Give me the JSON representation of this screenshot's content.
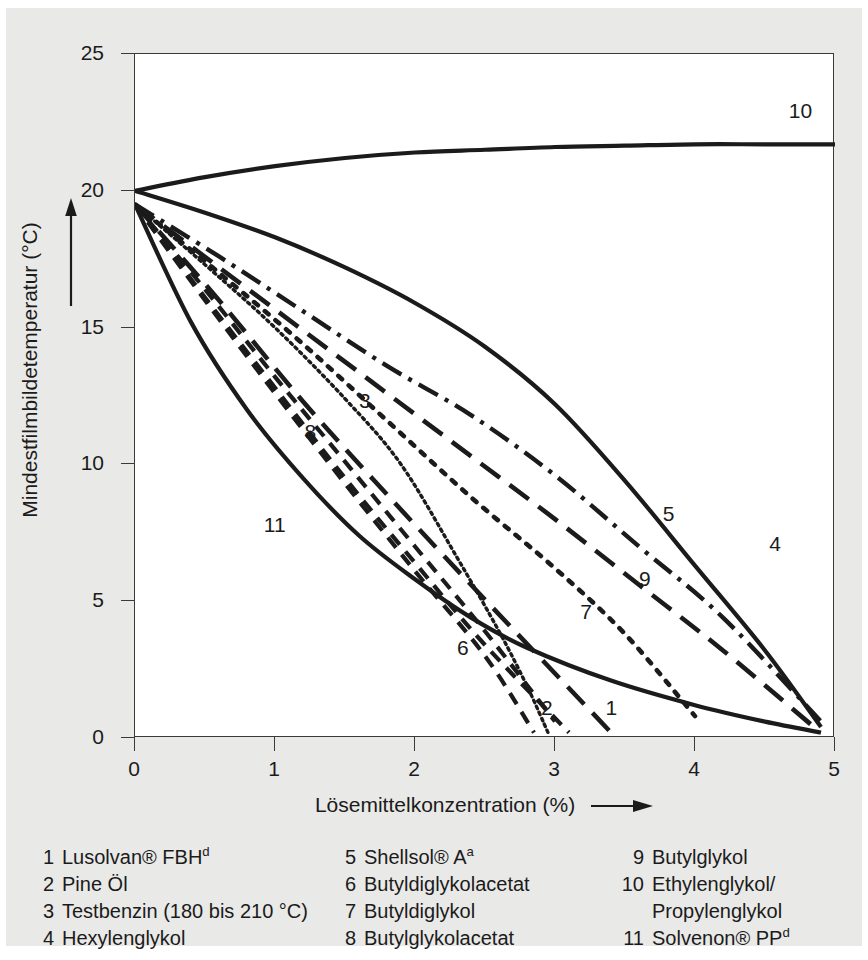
{
  "chart_data": {
    "type": "line",
    "title": "",
    "xlabel": "Lösemittelkonzentration (%)",
    "ylabel": "Mindestfilmbildetemperatur (°C)",
    "xlim": [
      0,
      5
    ],
    "ylim": [
      0,
      25
    ],
    "xticks": [
      0,
      1,
      2,
      3,
      4,
      5
    ],
    "yticks": [
      0,
      5,
      10,
      15,
      20,
      25
    ],
    "xtick_labels": [
      "0",
      "1",
      "2",
      "3",
      "4",
      "5"
    ],
    "ytick_labels": [
      "0",
      "5",
      "10",
      "15",
      "20",
      "25"
    ],
    "grid": false,
    "legend_position": "below-plot",
    "x_axis_arrow": true,
    "y_axis_arrow": true,
    "series": [
      {
        "name": "1",
        "label": "Lusolvan® FBH",
        "style": "long-dash",
        "points": [
          [
            0,
            19.5
          ],
          [
            0.6,
            16.0
          ],
          [
            1.2,
            12.3
          ],
          [
            1.8,
            8.9
          ],
          [
            2.4,
            5.6
          ],
          [
            2.9,
            2.9
          ],
          [
            3.4,
            0.2
          ]
        ]
      },
      {
        "name": "2",
        "label": "Pine Öl",
        "style": "dashed",
        "points": [
          [
            0,
            19.5
          ],
          [
            0.5,
            16.1
          ],
          [
            1.0,
            12.8
          ],
          [
            1.5,
            9.5
          ],
          [
            2.0,
            6.4
          ],
          [
            2.5,
            3.4
          ],
          [
            3.1,
            0.2
          ]
        ]
      },
      {
        "name": "3",
        "label": "Testbenzin (180 bis 210 °C)",
        "style": "fine-dot",
        "points": [
          [
            0,
            19.5
          ],
          [
            0.5,
            17.3
          ],
          [
            1.0,
            15.0
          ],
          [
            1.5,
            12.4
          ],
          [
            1.9,
            10.0
          ],
          [
            2.3,
            6.6
          ],
          [
            2.6,
            3.9
          ],
          [
            2.8,
            1.9
          ],
          [
            2.95,
            0.2
          ]
        ]
      },
      {
        "name": "4",
        "label": "Hexylenglykol",
        "style": "solid",
        "points": [
          [
            0,
            20.0
          ],
          [
            0.5,
            19.2
          ],
          [
            1.0,
            18.3
          ],
          [
            1.5,
            17.2
          ],
          [
            2.0,
            15.9
          ],
          [
            2.5,
            14.3
          ],
          [
            3.0,
            12.2
          ],
          [
            3.5,
            9.4
          ],
          [
            4.0,
            6.3
          ],
          [
            4.5,
            3.2
          ],
          [
            4.9,
            0.4
          ]
        ]
      },
      {
        "name": "5",
        "label": "Shellsol® A",
        "style": "dash-dot",
        "points": [
          [
            0,
            19.5
          ],
          [
            0.6,
            17.6
          ],
          [
            1.2,
            15.6
          ],
          [
            1.8,
            13.6
          ],
          [
            2.4,
            11.8
          ],
          [
            3.0,
            9.6
          ],
          [
            3.6,
            7.0
          ],
          [
            4.2,
            4.4
          ],
          [
            4.9,
            0.6
          ]
        ]
      },
      {
        "name": "6",
        "label": "Butyldiglykolacetat",
        "style": "dashed",
        "points": [
          [
            0,
            19.5
          ],
          [
            0.5,
            16.0
          ],
          [
            1.0,
            12.6
          ],
          [
            1.5,
            9.3
          ],
          [
            2.0,
            6.1
          ],
          [
            2.5,
            3.0
          ],
          [
            2.85,
            0.2
          ]
        ]
      },
      {
        "name": "7",
        "label": "Butyldiglykol",
        "style": "dotted",
        "points": [
          [
            0,
            19.5
          ],
          [
            0.6,
            17.0
          ],
          [
            1.2,
            14.4
          ],
          [
            1.8,
            11.6
          ],
          [
            2.4,
            8.8
          ],
          [
            3.0,
            6.2
          ],
          [
            3.5,
            3.8
          ],
          [
            4.0,
            0.8
          ]
        ]
      },
      {
        "name": "8",
        "label": "Butylglykolacetat",
        "style": "dashed",
        "points": [
          [
            0,
            19.5
          ],
          [
            0.5,
            16.4
          ],
          [
            1.0,
            13.2
          ],
          [
            1.5,
            10.1
          ],
          [
            2.0,
            7.0
          ],
          [
            2.5,
            3.9
          ],
          [
            3.0,
            0.6
          ]
        ]
      },
      {
        "name": "9",
        "label": "Butylglykol",
        "style": "long-dash",
        "points": [
          [
            0,
            19.5
          ],
          [
            0.6,
            17.2
          ],
          [
            1.2,
            14.9
          ],
          [
            1.8,
            12.6
          ],
          [
            2.4,
            10.3
          ],
          [
            3.0,
            8.0
          ],
          [
            3.6,
            5.6
          ],
          [
            4.2,
            3.2
          ],
          [
            4.85,
            0.4
          ]
        ]
      },
      {
        "name": "10",
        "label": "Ethylenglykol/Propylenglykol",
        "style": "solid",
        "points": [
          [
            0,
            20.0
          ],
          [
            0.5,
            20.5
          ],
          [
            1.0,
            20.9
          ],
          [
            1.5,
            21.2
          ],
          [
            2.0,
            21.4
          ],
          [
            2.5,
            21.5
          ],
          [
            3.0,
            21.6
          ],
          [
            3.5,
            21.65
          ],
          [
            4.0,
            21.7
          ],
          [
            4.5,
            21.7
          ],
          [
            5.0,
            21.7
          ]
        ]
      },
      {
        "name": "11",
        "label": "Solvenon® PP",
        "style": "solid",
        "points": [
          [
            0,
            19.5
          ],
          [
            0.4,
            15.2
          ],
          [
            0.8,
            12.0
          ],
          [
            1.2,
            9.5
          ],
          [
            1.6,
            7.4
          ],
          [
            2.0,
            5.8
          ],
          [
            2.4,
            4.4
          ],
          [
            2.8,
            3.3
          ],
          [
            3.4,
            2.1
          ],
          [
            4.0,
            1.2
          ],
          [
            4.5,
            0.6
          ],
          [
            4.9,
            0.2
          ]
        ]
      }
    ],
    "curve_annotations": [
      {
        "name": "1",
        "text": "1",
        "x": 3.36,
        "y": 1.1
      },
      {
        "name": "2",
        "text": "2",
        "x": 2.9,
        "y": 1.1
      },
      {
        "name": "3",
        "text": "3",
        "x": 1.6,
        "y": 12.3
      },
      {
        "name": "4",
        "text": "4",
        "x": 4.53,
        "y": 7.1
      },
      {
        "name": "5",
        "text": "5",
        "x": 3.77,
        "y": 8.2
      },
      {
        "name": "6",
        "text": "6",
        "x": 2.3,
        "y": 3.3
      },
      {
        "name": "7",
        "text": "7",
        "x": 3.18,
        "y": 4.6
      },
      {
        "name": "8",
        "text": "8",
        "x": 1.21,
        "y": 11.2
      },
      {
        "name": "9",
        "text": "9",
        "x": 3.6,
        "y": 5.8
      },
      {
        "name": "10",
        "text": "10",
        "x": 4.67,
        "y": 22.9
      },
      {
        "name": "11",
        "text": "11",
        "x": 0.92,
        "y": 7.8
      }
    ]
  },
  "legend": {
    "col1": [
      {
        "num": "1",
        "text": "Lusolvan® FBH",
        "sup": "d"
      },
      {
        "num": "2",
        "text": "Pine Öl",
        "sup": ""
      },
      {
        "num": "3",
        "text": "Testbenzin (180 bis 210 °C)",
        "sup": ""
      },
      {
        "num": "4",
        "text": "Hexylenglykol",
        "sup": ""
      }
    ],
    "col2": [
      {
        "num": "5",
        "text": "Shellsol® A",
        "sup": "a"
      },
      {
        "num": "6",
        "text": "Butyldiglykolacetat",
        "sup": ""
      },
      {
        "num": "7",
        "text": "Butyldiglykol",
        "sup": ""
      },
      {
        "num": "8",
        "text": "Butylglykolacetat",
        "sup": ""
      }
    ],
    "col3": [
      {
        "num": "9",
        "text": "Butylglykol",
        "sup": ""
      },
      {
        "num": "10",
        "text": "Ethylenglykol/",
        "sup": ""
      },
      {
        "num": "",
        "text": "Propylenglykol",
        "sup": ""
      },
      {
        "num": "11",
        "text": "Solvenon® PP",
        "sup": "d"
      }
    ]
  },
  "colors": {
    "paper": "#e9e9e7",
    "plot_background": "#ffffff",
    "ink": "#1b1b1b",
    "axis": "#3a3a3a"
  }
}
